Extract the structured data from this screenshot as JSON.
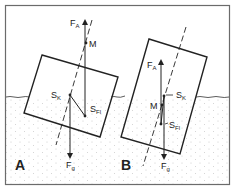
{
  "colors": {
    "frame": "#6b6b6b",
    "line": "#222222",
    "stipple": "#c8c8c8"
  },
  "panels": [
    {
      "label": "A",
      "forces": {
        "buoyancy": {
          "symbol": "F",
          "sub": "A"
        },
        "gravity": {
          "symbol": "F",
          "sub": "g"
        }
      },
      "points": {
        "metacenter": "M",
        "center_of_mass": {
          "symbol": "S",
          "sub": "K"
        },
        "center_of_buoyancy": {
          "symbol": "S",
          "sub": "Fl"
        }
      }
    },
    {
      "label": "B",
      "forces": {
        "buoyancy": {
          "symbol": "F",
          "sub": "A"
        },
        "gravity": {
          "symbol": "F",
          "sub": "g"
        }
      },
      "points": {
        "metacenter": "M",
        "center_of_mass": {
          "symbol": "S",
          "sub": "K"
        },
        "center_of_buoyancy": {
          "symbol": "S",
          "sub": "Fl"
        }
      }
    }
  ]
}
